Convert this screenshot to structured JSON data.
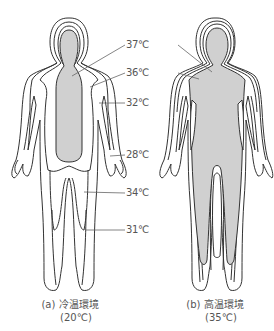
{
  "figure": {
    "panels": [
      {
        "id": "a",
        "caption_line1": "(a) 冷温環境",
        "caption_line2": "(20℃)",
        "environment_temperature": "20℃",
        "description": "Cold environment body temperature distribution"
      },
      {
        "id": "b",
        "caption_line1": "(b) 高温環境",
        "caption_line2": "(35℃)",
        "environment_temperature": "35℃",
        "description": "Hot environment body temperature distribution"
      }
    ],
    "isotherm_labels": [
      {
        "text": "37℃",
        "value": 37
      },
      {
        "text": "36℃",
        "value": 36
      },
      {
        "text": "32℃",
        "value": 32
      },
      {
        "text": "28℃",
        "value": 28
      },
      {
        "text": "34℃",
        "value": 34
      },
      {
        "text": "31℃",
        "value": 31
      }
    ],
    "colors": {
      "core_fill": "#d0d0d0",
      "outline": "#333333",
      "leader_line": "#666666"
    }
  }
}
